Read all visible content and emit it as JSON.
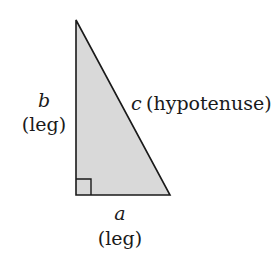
{
  "diagram": {
    "type": "right-triangle",
    "fill_color": "#d9d9d9",
    "stroke_color": "#1a1a1a",
    "labels": {
      "leg_b_var": "b",
      "leg_b_desc": "(leg)",
      "hyp_var": "c",
      "hyp_desc": "(hypotenuse)",
      "leg_a_var": "a",
      "leg_a_desc": "(leg)"
    }
  }
}
